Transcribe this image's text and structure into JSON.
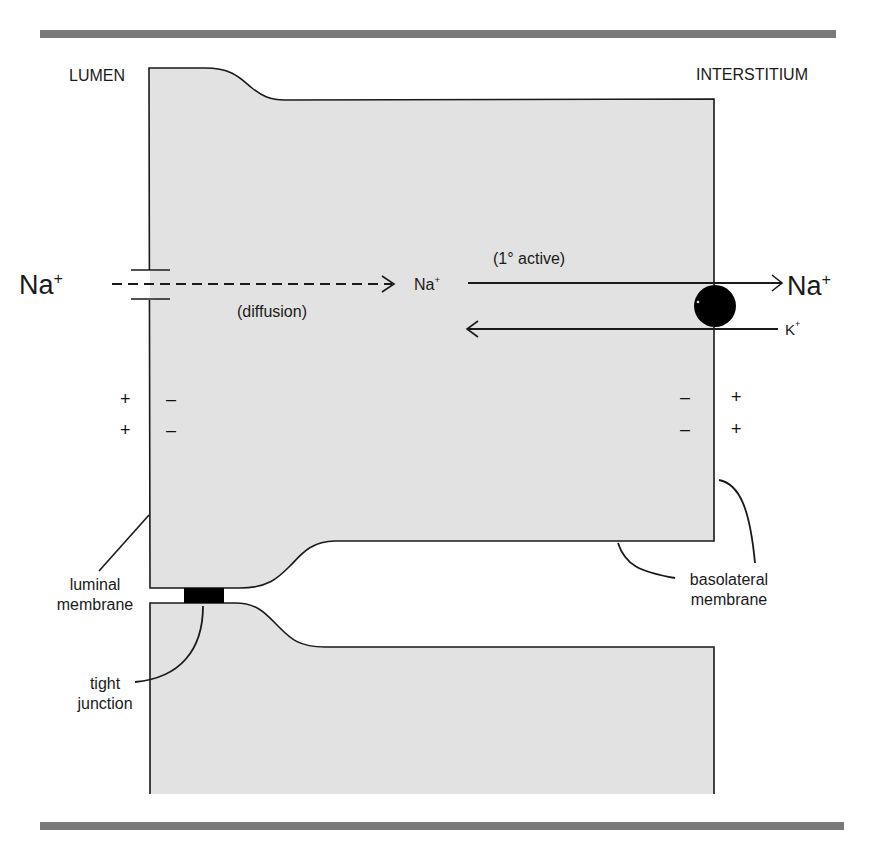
{
  "regions": {
    "lumen": "LUMEN",
    "interstitium": "INTERSTITIUM"
  },
  "transport": {
    "luminal_ion": "Na",
    "luminal_ion_charge": "+",
    "diffusion_label": "(diffusion)",
    "intracellular_ion": "Na",
    "intracellular_ion_charge": "+",
    "active_label": "(1° active)",
    "interstitial_ion": "Na",
    "interstitial_ion_charge": "+",
    "potassium_ion": "K",
    "potassium_ion_charge": "+"
  },
  "charges": {
    "lumen_side": [
      "+",
      "+"
    ],
    "luminal_cell_side": [
      "–",
      "–"
    ],
    "basolateral_cell_side": [
      "–",
      "–"
    ],
    "interstitium_side": [
      "+",
      "+"
    ]
  },
  "annotations": {
    "luminal_membrane_line1": "luminal",
    "luminal_membrane_line2": "membrane",
    "tight_junction_line1": "tight",
    "tight_junction_line2": "junction",
    "basolateral_line1": "basolateral",
    "basolateral_line2": "membrane"
  },
  "colors": {
    "cell_fill": "#e2e2e2",
    "outline": "#1a1a1a",
    "rule_bar": "#7a7a7a",
    "pump": "#000000",
    "tight_junction": "#000000"
  }
}
